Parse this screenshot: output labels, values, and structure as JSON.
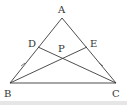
{
  "diagram": {
    "type": "geometry",
    "points": {
      "A": {
        "label": "A",
        "x": 62,
        "y": 18,
        "lx": 58,
        "ly": 13
      },
      "B": {
        "label": "B",
        "x": 10,
        "y": 83,
        "lx": 4,
        "ly": 97
      },
      "C": {
        "label": "C",
        "x": 116,
        "y": 83,
        "lx": 112,
        "ly": 97
      },
      "D": {
        "label": "D",
        "x": 38,
        "y": 47,
        "lx": 28,
        "ly": 47
      },
      "E": {
        "label": "E",
        "x": 87,
        "y": 47,
        "lx": 90,
        "ly": 47
      },
      "P": {
        "label": "P",
        "x": 63,
        "y": 58,
        "lx": 58,
        "ly": 52
      }
    },
    "segments": [
      "AB",
      "AC",
      "BC",
      "BE",
      "CD"
    ],
    "tick_marks": [
      {
        "segment": "DB",
        "count": 1
      },
      {
        "segment": "EC",
        "count": 1
      }
    ],
    "colors": {
      "line": "#3a3a3a",
      "label": "#333333",
      "background": "#ffffff"
    }
  }
}
